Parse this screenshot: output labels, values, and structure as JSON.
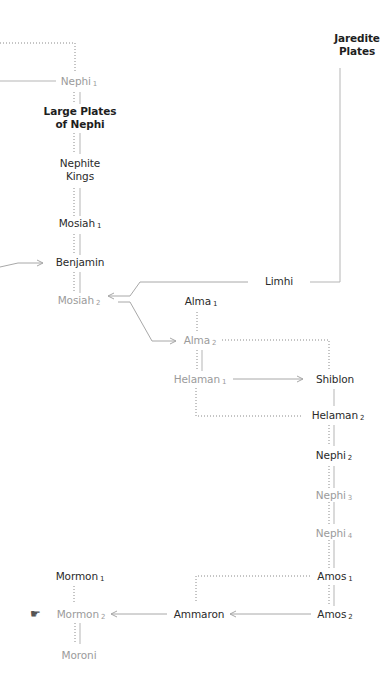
{
  "diagram": {
    "colors": {
      "text_dark": "#2a2a2a",
      "text_light": "#9b9b9b",
      "line": "#a8a8a8",
      "dotted": "#8a8a8a"
    },
    "nodes": {
      "jaredite_plates": {
        "line1": "Jaredite",
        "line2": "Plates",
        "style": "bold"
      },
      "nephi1": {
        "name": "Nephi",
        "sub": "1",
        "style": "light"
      },
      "large_plates": {
        "line1": "Large Plates",
        "line2": "of Nephi",
        "style": "bold"
      },
      "nephite_kings": {
        "line1": "Nephite",
        "line2": "Kings",
        "style": "dark"
      },
      "mosiah1": {
        "name": "Mosiah",
        "sub": "1",
        "style": "dark"
      },
      "benjamin": {
        "name": "Benjamin",
        "style": "dark"
      },
      "mosiah2": {
        "name": "Mosiah",
        "sub": "2",
        "style": "light"
      },
      "limhi": {
        "name": "Limhi",
        "style": "dark"
      },
      "alma1": {
        "name": "Alma",
        "sub": "1",
        "style": "dark"
      },
      "alma2": {
        "name": "Alma",
        "sub": "2",
        "style": "light"
      },
      "helaman1": {
        "name": "Helaman",
        "sub": "1",
        "style": "light"
      },
      "shiblon": {
        "name": "Shiblon",
        "style": "dark"
      },
      "helaman2": {
        "name": "Helaman",
        "sub": "2",
        "style": "dark"
      },
      "nephi2": {
        "name": "Nephi",
        "sub": "2",
        "style": "dark"
      },
      "nephi3": {
        "name": "Nephi",
        "sub": "3",
        "style": "light"
      },
      "nephi4": {
        "name": "Nephi",
        "sub": "4",
        "style": "light"
      },
      "amos1": {
        "name": "Amos",
        "sub": "1",
        "style": "dark"
      },
      "amos2": {
        "name": "Amos",
        "sub": "2",
        "style": "dark"
      },
      "ammaron": {
        "name": "Ammaron",
        "style": "dark"
      },
      "mormon1": {
        "name": "Mormon",
        "sub": "1",
        "style": "dark"
      },
      "mormon2": {
        "name": "Mormon",
        "sub": "2",
        "style": "light"
      },
      "moroni": {
        "name": "Moroni",
        "style": "light"
      }
    },
    "icons": {
      "pointing_hand": "☛"
    }
  }
}
